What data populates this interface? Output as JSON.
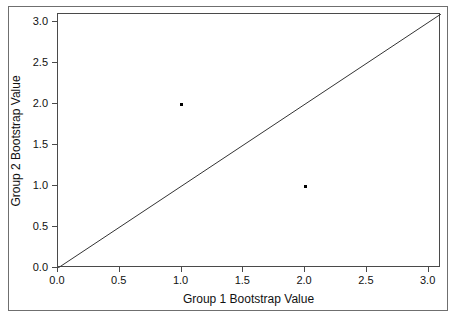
{
  "chart_data": {
    "type": "scatter",
    "title": "",
    "xlabel": "Group 1 Bootstrap Value",
    "ylabel": "Group 2 Bootstrap Value",
    "xlim": [
      0.0,
      3.1
    ],
    "ylim": [
      0.0,
      3.1
    ],
    "xticks": [
      0.0,
      0.5,
      1.0,
      1.5,
      2.0,
      2.5,
      3.0
    ],
    "yticks": [
      0.0,
      0.5,
      1.0,
      1.5,
      2.0,
      2.5,
      3.0
    ],
    "xticklabels": [
      "0.0",
      "0.5",
      "1.0",
      "1.5",
      "2.0",
      "2.5",
      "3.0"
    ],
    "yticklabels": [
      "0.0",
      "0.5",
      "1.0",
      "1.5",
      "2.0",
      "2.5",
      "3.0"
    ],
    "grid": false,
    "legend": null,
    "marker_color": "#000000",
    "line_color": "#333333",
    "frame_color": "#4a4a4a",
    "background": "#ffffff",
    "points": [
      {
        "x": 1.0,
        "y": 2.0
      },
      {
        "x": 2.0,
        "y": 1.0
      }
    ],
    "annotations": [
      {
        "kind": "reference-line",
        "description": "identity line y = x",
        "from": [
          0.0,
          0.0
        ],
        "to": [
          3.1,
          3.1
        ]
      }
    ]
  }
}
